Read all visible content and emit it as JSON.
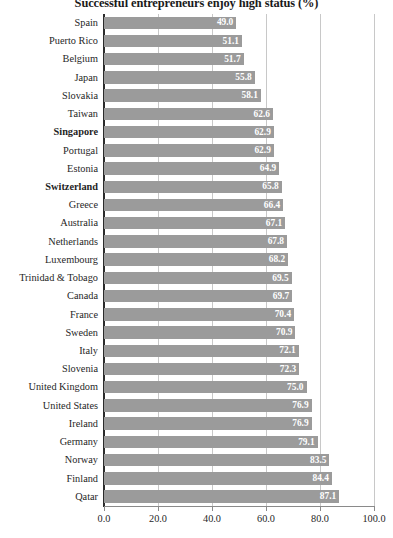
{
  "chart_data": {
    "type": "bar",
    "orientation": "horizontal",
    "title": "Successful entrepreneurs enjoy high status (%)",
    "xlabel": "",
    "ylabel": "",
    "xlim": [
      0.0,
      100.0
    ],
    "xticks": [
      "0.0",
      "20.0",
      "40.0",
      "60.0",
      "80.0",
      "100.0"
    ],
    "xtick_values": [
      0,
      20,
      40,
      60,
      80,
      100
    ],
    "grid": true,
    "legend": null,
    "bar_color": "#9b9b9b",
    "value_label_color": "#ffffff",
    "categories": [
      "Spain",
      "Puerto Rico",
      "Belgium",
      "Japan",
      "Slovakia",
      "Taiwan",
      "Singapore",
      "Portugal",
      "Estonia",
      "Switzerland",
      "Greece",
      "Australia",
      "Netherlands",
      "Luxembourg",
      "Trinidad & Tobago",
      "Canada",
      "France",
      "Sweden",
      "Italy",
      "Slovenia",
      "United Kingdom",
      "United States",
      "Ireland",
      "Germany",
      "Norway",
      "Finland",
      "Qatar"
    ],
    "values": [
      49.0,
      51.1,
      51.7,
      55.8,
      58.1,
      62.6,
      62.9,
      62.9,
      64.9,
      65.8,
      66.4,
      67.1,
      67.8,
      68.2,
      69.5,
      69.7,
      70.4,
      70.9,
      72.1,
      72.3,
      75.0,
      76.9,
      76.9,
      79.1,
      83.5,
      84.4,
      87.1
    ],
    "value_labels": [
      "49.0",
      "51.1",
      "51.7",
      "55.8",
      "58.1",
      "62.6",
      "62.9",
      "62.9",
      "64.9",
      "65.8",
      "66.4",
      "67.1",
      "67.8",
      "68.2",
      "69.5",
      "69.7",
      "70.4",
      "70.9",
      "72.1",
      "72.3",
      "75.0",
      "76.9",
      "76.9",
      "79.1",
      "83.5",
      "84.4",
      "87.1"
    ],
    "highlighted_categories": [
      "Singapore",
      "Switzerland"
    ]
  }
}
